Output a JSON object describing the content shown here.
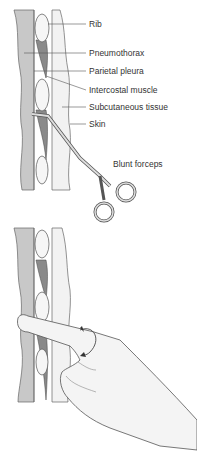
{
  "figure": {
    "top_panel": {
      "labels": [
        {
          "id": "rib",
          "text": "Rib"
        },
        {
          "id": "pneumothorax",
          "text": "Pneumothorax"
        },
        {
          "id": "parietal-pleura",
          "text": "Parietal pleura"
        },
        {
          "id": "intercostal-muscle",
          "text": "Intercostal muscle"
        },
        {
          "id": "subcutaneous-tissue",
          "text": "Subcutaneous tissue"
        },
        {
          "id": "skin",
          "text": "Skin"
        },
        {
          "id": "blunt-forceps",
          "text": "Blunt forceps"
        }
      ]
    },
    "bottom_panel": {
      "description": "Finger inserted through incision with rotation arrow"
    },
    "colors": {
      "pleura": "#c8c8c8",
      "muscle": "#8a8a8a",
      "rib": "#f4f4f4",
      "skin": "#f0f0f0",
      "line": "#555555"
    }
  }
}
